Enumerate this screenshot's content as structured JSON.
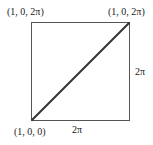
{
  "diagram": {
    "square": {
      "x": 31,
      "y": 22,
      "size": 98,
      "stroke": "#555555",
      "diagonal_stroke": "#333333"
    },
    "labels": {
      "top_left": "(1, 0, 2π)",
      "top_right": "(1, 0, 2π)",
      "bottom_left": "(1, 0, 0)",
      "bottom_side": "2π",
      "right_side": "2π"
    }
  }
}
